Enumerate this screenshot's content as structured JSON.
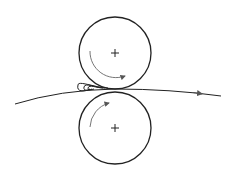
{
  "diagram": {
    "colors": {
      "stroke": "#222222",
      "arrow": "#666666",
      "background": "#ffffff"
    },
    "rolls": [
      {
        "id": "top-roll",
        "cx": 115,
        "cy": 53,
        "r": 36,
        "rotation": "clockwise",
        "center_mark": "+"
      },
      {
        "id": "bottom-roll",
        "cx": 115,
        "cy": 128,
        "r": 36,
        "rotation": "clockwise",
        "center_mark": "+"
      }
    ],
    "web": {
      "direction": "left-to-right",
      "start": [
        15,
        104
      ],
      "end": [
        221,
        96
      ]
    },
    "bank": {
      "location": "upstream side of nip",
      "loops": 3
    }
  }
}
